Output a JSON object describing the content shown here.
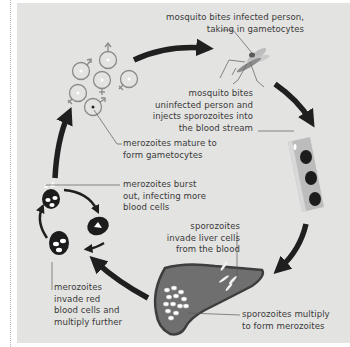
{
  "diagram": {
    "colors": {
      "background": "#e3e3e1",
      "arrow": "#1f1f1f",
      "text": "#3a3a3a",
      "leader_line": "#5a5a5a",
      "cell_dark": "#1c1c1c",
      "liver": "#6f6f6f",
      "liver_outline": "#3e3e3e",
      "blood_vessel": "#b9b9b9",
      "gametocyte_ring": "#8a8a8a"
    },
    "labels": {
      "mosquito_infected": [
        "mosquito bites infected person,",
        "taking in gametocytes"
      ],
      "mosquito_uninfected": [
        "mosquito bites",
        "uninfected person and",
        "injects sporozoites into",
        "the blood stream"
      ],
      "gametocytes": [
        "merozoites mature to",
        "form gametocytes"
      ],
      "burst": [
        "merozoites burst",
        "out, infecting more",
        "blood cells"
      ],
      "liver_invade": [
        "sporozoites",
        "invade liver cells",
        "from the blood"
      ],
      "invade_red": [
        "merozoites",
        "invade red",
        "blood cells and",
        "multiply further"
      ],
      "multiply": [
        "sporozoites multiply",
        "to form merozoites"
      ]
    },
    "icons": {
      "mosquito": "mosquito-icon",
      "blood_vessel": "blood-vessel-icon",
      "liver": "liver-icon",
      "red_blood_cell": "red-blood-cell-icon",
      "gametocyte": "gametocyte-icon",
      "cycle_arrow": "arrow-icon"
    }
  }
}
